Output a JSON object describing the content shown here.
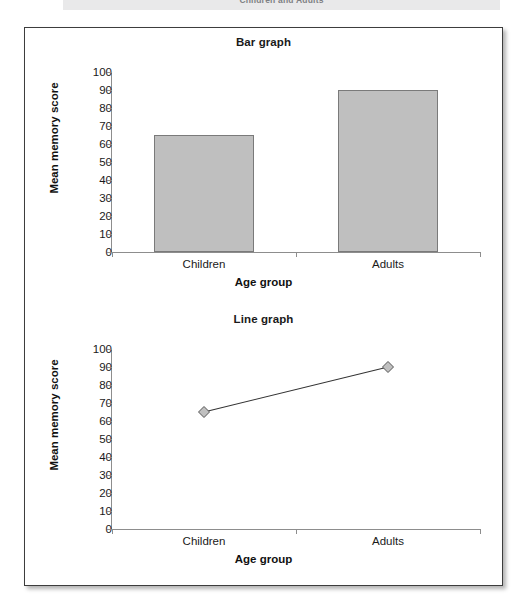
{
  "banner": {
    "running_head": "Children and Adults"
  },
  "chart_data": [
    {
      "id": "bar",
      "type": "bar",
      "title": "Bar graph",
      "xlabel": "Age group",
      "ylabel": "Mean memory score",
      "categories": [
        "Children",
        "Adults"
      ],
      "values": [
        65,
        90
      ],
      "ylim": [
        0,
        100
      ],
      "yticks": [
        0,
        10,
        20,
        30,
        40,
        50,
        60,
        70,
        80,
        90,
        100
      ],
      "grid": false,
      "legend": "none",
      "bar_fill_color": "#bfbfbf",
      "bar_border_color": "#7a7a7a"
    },
    {
      "id": "line",
      "type": "line",
      "title": "Line graph",
      "xlabel": "Age group",
      "ylabel": "Mean memory score",
      "categories": [
        "Children",
        "Adults"
      ],
      "values": [
        65,
        90
      ],
      "ylim": [
        0,
        100
      ],
      "yticks": [
        0,
        10,
        20,
        30,
        40,
        50,
        60,
        70,
        80,
        90,
        100
      ],
      "grid": false,
      "legend": "none",
      "marker": "diamond",
      "marker_fill_color": "#c0c0c0",
      "marker_border_color": "#555555",
      "line_color": "#333333"
    }
  ]
}
